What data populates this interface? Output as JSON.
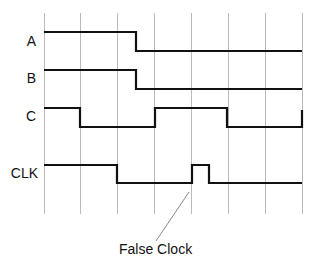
{
  "diagram": {
    "type": "timing-diagram",
    "signals": [
      {
        "name": "A",
        "label_y": 41
      },
      {
        "name": "B",
        "label_y": 78
      },
      {
        "name": "C",
        "label_y": 116
      },
      {
        "name": "CLK",
        "label_y": 173
      }
    ],
    "annotation": {
      "text": "False Clock"
    },
    "colors": {
      "signal": "#111111",
      "grid": "#b8b8b8",
      "pointer": "#888888"
    }
  }
}
